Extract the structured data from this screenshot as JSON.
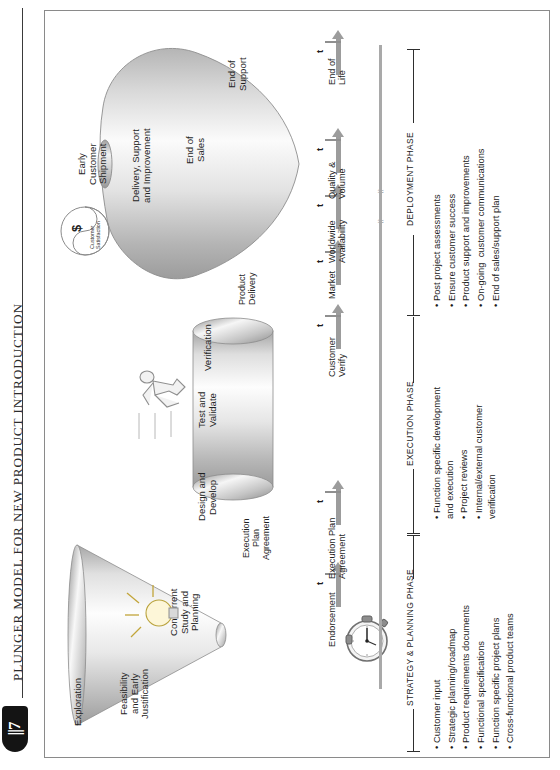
{
  "figure": {
    "title": "PLUNGER MODEL FOR NEW PRODUCT INTRODUCTION",
    "logo_glyph": "||7"
  },
  "shapes": {
    "cone": {
      "name": "strategy-planning-cone",
      "stages": [
        "Exploration",
        "Feasibility\nand Early\nJustification",
        "Concurrent\nStudy and\nPlanning"
      ]
    },
    "cylinder": {
      "name": "execution-cylinder",
      "stages": [
        "Design and\nDevelop",
        "Test and\nValidate",
        "Verification"
      ]
    },
    "balloon": {
      "name": "deployment-balloon",
      "stages": [
        "Early\nCustomer\nShipment",
        "Delivery, Support\nand Improvement",
        "End of\nSales",
        "End of\nSupport"
      ]
    }
  },
  "connectors": {
    "execution_plan_agreement": "Execution\nPlan\nAgreement",
    "product_delivery": "Product\nDelivery"
  },
  "icons": {
    "stopwatch": "stopwatch-icon",
    "lightbulb": "lightbulb-icon",
    "runner": "runner-icon",
    "customer_satisfaction": {
      "symbol": "$",
      "label": "Customer\nSatisfaction"
    }
  },
  "timeline": {
    "marker_symbol": "t",
    "milestones": [
      "Endorsement",
      "Execution Plan\nAgreement",
      "Customer\nVerify",
      "Market",
      "Worldwide\nAvailability",
      "Quality &\nVolume",
      "End of\nLife"
    ]
  },
  "phases": [
    {
      "label": "STRATEGY & PLANNING PHASE"
    },
    {
      "label": "EXECUTION PHASE"
    },
    {
      "label": "DEPLOYMENT PHASE"
    }
  ],
  "bullet_groups": [
    {
      "phase": "STRATEGY & PLANNING PHASE",
      "items": [
        "Customer input",
        "Strategic planning/roadmap",
        "Product requirements documents",
        "Functional specifications",
        "Function specific project plans",
        "Cross-functional product teams"
      ]
    },
    {
      "phase": "EXECUTION PHASE",
      "items": [
        "Function specific development\nand execution",
        "Project reviews",
        "Internal/external customer\nverification"
      ]
    },
    {
      "phase": "DEPLOYMENT PHASE",
      "items": [
        "Post project assessments",
        "Ensure customer success",
        "Product support and improvements",
        "On-going  customer communications",
        "End of sales/support plan"
      ]
    }
  ],
  "colors": {
    "ink": "#1c1c1c",
    "shape_light": "#fcfcfc",
    "shape_mid": "#c9c9c9",
    "shape_dark": "#9a9a9a",
    "axis": "#9c9c9c",
    "border": "#8a8a8a"
  }
}
